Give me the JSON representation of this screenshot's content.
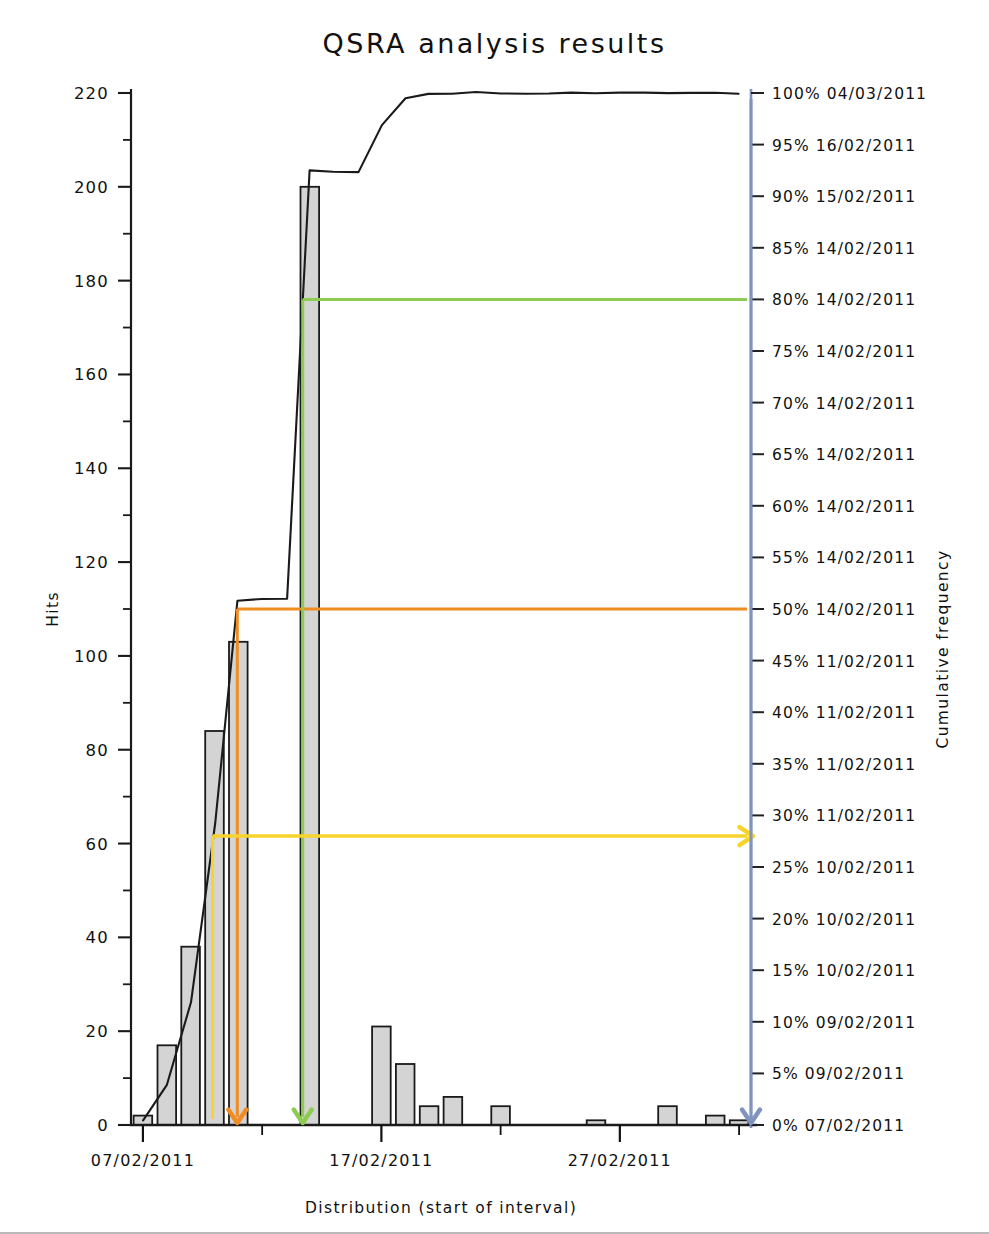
{
  "chart_data": {
    "type": "bar",
    "title": "QSRA analysis results",
    "xlabel": "Distribution (start of interval)",
    "ylabel": "Hits",
    "y2label": "Cumulative frequency",
    "grid": false,
    "legend": "none",
    "ylim": [
      0,
      220
    ],
    "y_ticks": [
      0,
      20,
      40,
      60,
      80,
      100,
      120,
      140,
      160,
      180,
      200,
      220
    ],
    "y_tick_labels": [
      "0",
      "20",
      "40",
      "60",
      "80",
      "100",
      "120",
      "140",
      "160",
      "180",
      "200",
      "220"
    ],
    "y_minor_step": 10,
    "x_tick_labels": [
      "07/02/2011",
      "17/02/2011",
      "27/02/2011"
    ],
    "x_tick_positions": [
      0,
      10,
      20
    ],
    "y2lim": [
      0,
      100
    ],
    "y2_ticks": [
      0,
      5,
      10,
      15,
      20,
      25,
      30,
      35,
      40,
      45,
      50,
      55,
      60,
      65,
      70,
      75,
      80,
      85,
      90,
      95,
      100
    ],
    "y2_tick_labels": [
      "0% 07/02/2011",
      "5% 09/02/2011",
      "10% 09/02/2011",
      "15% 10/02/2011",
      "20% 10/02/2011",
      "25% 10/02/2011",
      "30% 11/02/2011",
      "35% 11/02/2011",
      "40% 11/02/2011",
      "45% 11/02/2011",
      "50% 14/02/2011",
      "55% 14/02/2011",
      "60% 14/02/2011",
      "65% 14/02/2011",
      "70% 14/02/2011",
      "75% 14/02/2011",
      "80% 14/02/2011",
      "85% 14/02/2011",
      "90% 15/02/2011",
      "95% 16/02/2011",
      "100% 04/03/2011"
    ],
    "categories": [
      "07/02/2011",
      "08/02/2011",
      "09/02/2011",
      "10/02/2011",
      "11/02/2011",
      "12/02/2011",
      "13/02/2011",
      "14/02/2011",
      "15/02/2011",
      "16/02/2011",
      "17/02/2011",
      "18/02/2011",
      "19/02/2011",
      "20/02/2011",
      "21/02/2011",
      "22/02/2011",
      "23/02/2011",
      "24/02/2011",
      "25/02/2011",
      "26/02/2011",
      "27/02/2011",
      "28/02/2011",
      "01/03/2011",
      "02/03/2011",
      "03/03/2011",
      "04/03/2011"
    ],
    "values": [
      2,
      17,
      38,
      84,
      103,
      0,
      0,
      200,
      0,
      0,
      21,
      13,
      4,
      6,
      0,
      4,
      0,
      0,
      0,
      1,
      0,
      0,
      4,
      0,
      2,
      1
    ],
    "series": [
      {
        "name": "Hits",
        "type": "bar",
        "values": [
          2,
          17,
          38,
          84,
          103,
          0,
          0,
          200,
          0,
          0,
          21,
          13,
          4,
          6,
          0,
          4,
          0,
          0,
          0,
          1,
          0,
          0,
          4,
          0,
          2,
          1
        ]
      },
      {
        "name": "Cumulative frequency",
        "type": "line",
        "axis": "y2",
        "values": [
          0.4,
          4.0,
          11.9,
          29.4,
          50.9,
          50.9,
          50.9,
          92.4,
          92.4,
          92.4,
          96.8,
          99.5,
          100.3,
          101.6,
          101.6,
          102.4,
          102.4,
          102.4,
          102.4,
          102.6,
          102.6,
          102.6,
          103.4,
          103.4,
          103.8,
          104.0
        ]
      }
    ],
    "annotations": [
      {
        "name": "p50-marker",
        "label": "50%",
        "color": "#ef8c22",
        "y2_value": 50,
        "direction": "down-right"
      },
      {
        "name": "p80-marker",
        "label": "80%",
        "color": "#8ecb51",
        "y2_value": 80,
        "direction": "down-right"
      },
      {
        "name": "p28-marker",
        "label": "28%",
        "color": "#f7d42b",
        "y2_value": 28,
        "direction": "right"
      },
      {
        "name": "end-date-marker",
        "label": "0%",
        "color": "#7f94bf",
        "y2_value": 0,
        "direction": "down"
      }
    ],
    "colors": {
      "bar_fill": "#d4d4d4",
      "bar_edge": "#1a1a1a",
      "curve": "#1a1a1a",
      "left_axis": "#1a1a1a",
      "right_axis": "#7f94bf",
      "orange": "#ef8c22",
      "green": "#8ecb51",
      "yellow": "#f7d42b",
      "blue": "#7f94bf"
    }
  }
}
